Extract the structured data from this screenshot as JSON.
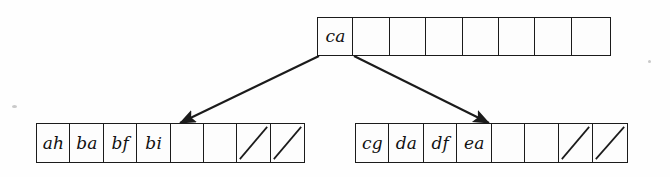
{
  "figure": {
    "ink_color": "#1b1b1b",
    "background_color": "#fefefe"
  },
  "nodes": [
    {
      "id": "root",
      "name": "root-node",
      "cells": [
        {
          "label": "ca",
          "empty": false,
          "slashed": false
        },
        {
          "label": "",
          "empty": true,
          "slashed": false
        },
        {
          "label": "",
          "empty": true,
          "slashed": false
        },
        {
          "label": "",
          "empty": true,
          "slashed": false
        },
        {
          "label": "",
          "empty": true,
          "slashed": false
        },
        {
          "label": "",
          "empty": true,
          "slashed": false
        },
        {
          "label": "",
          "empty": true,
          "slashed": false
        },
        {
          "label": "",
          "empty": true,
          "slashed": false
        }
      ]
    },
    {
      "id": "leaf-left",
      "name": "left-leaf-node",
      "cells": [
        {
          "label": "ah",
          "empty": false,
          "slashed": false
        },
        {
          "label": "ba",
          "empty": false,
          "slashed": false
        },
        {
          "label": "bf",
          "empty": false,
          "slashed": false
        },
        {
          "label": "bi",
          "empty": false,
          "slashed": false
        },
        {
          "label": "",
          "empty": true,
          "slashed": false
        },
        {
          "label": "",
          "empty": true,
          "slashed": false
        },
        {
          "label": "",
          "empty": true,
          "slashed": true
        },
        {
          "label": "",
          "empty": true,
          "slashed": true
        }
      ]
    },
    {
      "id": "leaf-right",
      "name": "right-leaf-node",
      "cells": [
        {
          "label": "cg",
          "empty": false,
          "slashed": false
        },
        {
          "label": "da",
          "empty": false,
          "slashed": false
        },
        {
          "label": "df",
          "empty": false,
          "slashed": false
        },
        {
          "label": "ea",
          "empty": false,
          "slashed": false
        },
        {
          "label": "",
          "empty": true,
          "slashed": false
        },
        {
          "label": "",
          "empty": true,
          "slashed": false
        },
        {
          "label": "",
          "empty": true,
          "slashed": true
        },
        {
          "label": "",
          "empty": true,
          "slashed": true
        }
      ]
    }
  ],
  "edges": [
    {
      "id": "edge-left",
      "name": "pointer-root-to-left-leaf",
      "from": "root",
      "to": "leaf-left"
    },
    {
      "id": "edge-right",
      "name": "pointer-root-to-right-leaf",
      "from": "root",
      "to": "leaf-right"
    }
  ]
}
